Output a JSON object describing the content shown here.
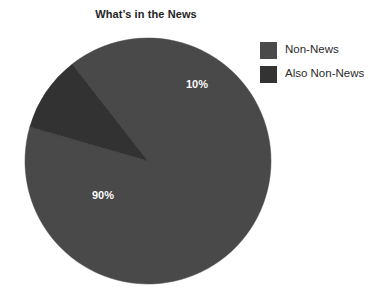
{
  "chart_data": {
    "type": "pie",
    "title": "What’s in the News",
    "xlabel": "",
    "ylabel": "",
    "grid": false,
    "legend_position": "top-right",
    "categories": [
      "Non-News",
      "Also Non-News"
    ],
    "values": [
      90,
      10
    ],
    "labels": [
      "90%",
      "10%"
    ],
    "colors": [
      "#4a4a4a",
      "#333333"
    ],
    "start_angle_deg": 322,
    "slices": [
      {
        "name": "Non-News",
        "value": 90,
        "label": "90%",
        "color": "#4a4a4a"
      },
      {
        "name": "Also Non-News",
        "value": 10,
        "label": "10%",
        "color": "#333333"
      }
    ]
  },
  "chart": {
    "title": "What’s in the News"
  },
  "legend": {
    "items": [
      {
        "label": "Non-News",
        "color": "#4a4a4a"
      },
      {
        "label": "Also Non-News",
        "color": "#333333"
      }
    ]
  },
  "geometry": {
    "center_x": 148,
    "center_y": 161,
    "radius": 123
  },
  "background": "#ffffff"
}
